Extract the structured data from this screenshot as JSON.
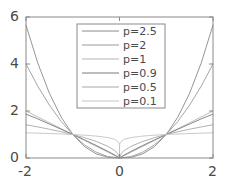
{
  "chart_data": {
    "type": "line",
    "title": "",
    "xlabel": "",
    "ylabel": "",
    "xlim": [
      -2,
      2
    ],
    "ylim": [
      0,
      6
    ],
    "xticks": [
      -2,
      0,
      2
    ],
    "yticks": [
      0,
      2,
      4,
      6
    ],
    "xtick_labels": [
      "-2",
      "0",
      "2"
    ],
    "ytick_labels": [
      "0",
      "2",
      "4",
      "6"
    ],
    "grid": false,
    "legend_position": "upper center",
    "function_form": "y = |x|^p",
    "series": [
      {
        "name": "p=2.5",
        "p": 2.5,
        "color": "#8a8a8a",
        "x": [
          -2,
          -1.75,
          -1.5,
          -1.25,
          -1,
          -0.75,
          -0.5,
          -0.25,
          0,
          0.25,
          0.5,
          0.75,
          1,
          1.25,
          1.5,
          1.75,
          2
        ],
        "values": [
          5.657,
          4.051,
          2.756,
          1.747,
          1,
          0.487,
          0.177,
          0.031,
          0,
          0.031,
          0.177,
          0.487,
          1,
          1.747,
          2.756,
          4.051,
          5.657
        ]
      },
      {
        "name": "p=2",
        "p": 2,
        "color": "#9a9a9a",
        "x": [
          -2,
          -1.75,
          -1.5,
          -1.25,
          -1,
          -0.75,
          -0.5,
          -0.25,
          0,
          0.25,
          0.5,
          0.75,
          1,
          1.25,
          1.5,
          1.75,
          2
        ],
        "values": [
          4,
          3.063,
          2.25,
          1.563,
          1,
          0.563,
          0.25,
          0.063,
          0,
          0.063,
          0.25,
          0.563,
          1,
          1.563,
          2.25,
          3.063,
          4
        ]
      },
      {
        "name": "p=1",
        "p": 1,
        "color": "#b4b4b4",
        "x": [
          -2,
          -1.5,
          -1,
          -0.5,
          0,
          0.5,
          1,
          1.5,
          2
        ],
        "values": [
          2,
          1.5,
          1,
          0.5,
          0,
          0.5,
          1,
          1.5,
          2
        ]
      },
      {
        "name": "p=0.9",
        "p": 0.9,
        "color": "#7a7a7a",
        "x": [
          -2,
          -1.75,
          -1.5,
          -1.25,
          -1,
          -0.75,
          -0.5,
          -0.25,
          -0.1,
          0,
          0.1,
          0.25,
          0.5,
          0.75,
          1,
          1.25,
          1.5,
          1.75,
          2
        ],
        "values": [
          1.866,
          1.666,
          1.445,
          1.225,
          1,
          0.772,
          0.536,
          0.287,
          0.126,
          0,
          0.126,
          0.287,
          0.536,
          0.772,
          1,
          1.225,
          1.445,
          1.666,
          1.866
        ]
      },
      {
        "name": "p=0.5",
        "p": 0.5,
        "color": "#a8a8a8",
        "x": [
          -2,
          -1.75,
          -1.5,
          -1.25,
          -1,
          -0.75,
          -0.5,
          -0.25,
          -0.1,
          -0.04,
          0,
          0.04,
          0.1,
          0.25,
          0.5,
          0.75,
          1,
          1.25,
          1.5,
          1.75,
          2
        ],
        "values": [
          1.414,
          1.323,
          1.225,
          1.118,
          1,
          0.866,
          0.707,
          0.5,
          0.316,
          0.2,
          0,
          0.2,
          0.316,
          0.5,
          0.707,
          0.866,
          1,
          1.118,
          1.225,
          1.323,
          1.414
        ]
      },
      {
        "name": "p=0.1",
        "p": 0.1,
        "color": "#c4c4c4",
        "x": [
          -2,
          -1.75,
          -1.5,
          -1.25,
          -1,
          -0.75,
          -0.5,
          -0.25,
          -0.1,
          -0.02,
          -0.005,
          -0.0005,
          0,
          0.0005,
          0.005,
          0.02,
          0.1,
          0.25,
          0.5,
          0.75,
          1,
          1.25,
          1.5,
          1.75,
          2
        ],
        "values": [
          1.072,
          1.057,
          1.041,
          1.023,
          1,
          0.972,
          0.933,
          0.871,
          0.794,
          0.675,
          0.587,
          0.466,
          0,
          0.466,
          0.587,
          0.675,
          0.794,
          0.871,
          0.933,
          0.972,
          1,
          1.023,
          1.041,
          1.057,
          1.072
        ]
      }
    ]
  },
  "axes": {
    "frame_color": "#8a8a8a"
  },
  "legend": {
    "items": [
      {
        "label": "p=2.5"
      },
      {
        "label": "p=2"
      },
      {
        "label": "p=1"
      },
      {
        "label": "p=0.9"
      },
      {
        "label": "p=0.5"
      },
      {
        "label": "p=0.1"
      }
    ],
    "border_color": "#8a8a8a"
  }
}
